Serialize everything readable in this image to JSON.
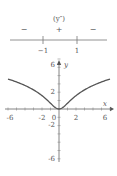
{
  "sign_chart": {
    "title": "(y″)",
    "signs": [
      "−",
      "+",
      "−"
    ],
    "breakpoints": [
      "−1",
      "1"
    ]
  },
  "chart_data": {
    "type": "line",
    "function": "y = ln(1 + x^2)",
    "xlabel": "x",
    "ylabel": "y",
    "xlim": [
      -6,
      6
    ],
    "ylim": [
      -6,
      6
    ],
    "x_tick_labels": [
      "-6",
      "-2",
      "0",
      "2",
      "6"
    ],
    "y_tick_labels": [
      "6",
      "2",
      "-2",
      "-6"
    ],
    "grid": false,
    "series": [
      {
        "name": "y",
        "x": [
          -6,
          -5,
          -4,
          -3,
          -2,
          -1,
          -0.5,
          0,
          0.5,
          1,
          2,
          3,
          4,
          5,
          6
        ],
        "values": [
          3.61,
          3.26,
          2.83,
          2.3,
          1.61,
          0.69,
          0.22,
          0,
          0.22,
          0.69,
          1.61,
          2.3,
          2.83,
          3.26,
          3.61
        ]
      }
    ]
  },
  "colors": {
    "axis": "#555555",
    "curve": "#555555"
  }
}
